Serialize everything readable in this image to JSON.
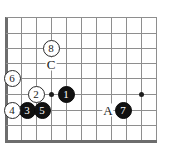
{
  "diagram": {
    "kind": "go-board-diagram",
    "width": 170,
    "height": 154,
    "background_color": "#ffffff",
    "grid_color": "#8e8e8e",
    "border_color": "#6d6d6d",
    "black_stone_color": "#111111",
    "white_stone_color": "#ffffff",
    "star_point_color": "#1d1d1d"
  },
  "grid": {
    "vertical_line_x": [
      6,
      21,
      36,
      51,
      66,
      81,
      96,
      111,
      126,
      141,
      156
    ],
    "horizontal_line_y": [
      17,
      33,
      48,
      63,
      78,
      94,
      110,
      125,
      140
    ],
    "left_edge_x": 6,
    "bottom_edge_y": 140
  },
  "star_points": [
    {
      "name": "star-point-left",
      "x": 51,
      "y": 94
    },
    {
      "name": "star-point-right",
      "x": 141,
      "y": 94
    }
  ],
  "stones": [
    {
      "name": "stone-1",
      "number": "1",
      "color": "black",
      "x": 66,
      "y": 94
    },
    {
      "name": "stone-2",
      "number": "2",
      "color": "white",
      "x": 36,
      "y": 94
    },
    {
      "name": "stone-3",
      "number": "3",
      "color": "black",
      "x": 27,
      "y": 110
    },
    {
      "name": "stone-4",
      "number": "4",
      "color": "white",
      "x": 12,
      "y": 110
    },
    {
      "name": "stone-5",
      "number": "5",
      "color": "black",
      "x": 42,
      "y": 110
    },
    {
      "name": "stone-6",
      "number": "6",
      "color": "white",
      "x": 12,
      "y": 78
    },
    {
      "name": "stone-7",
      "number": "7",
      "color": "black",
      "x": 123,
      "y": 110
    },
    {
      "name": "stone-8",
      "number": "8",
      "color": "white",
      "x": 51,
      "y": 48
    }
  ],
  "labels": [
    {
      "name": "label-c",
      "text": "C",
      "x": 51,
      "y": 64
    },
    {
      "name": "label-a",
      "text": "A",
      "x": 108,
      "y": 110
    }
  ]
}
